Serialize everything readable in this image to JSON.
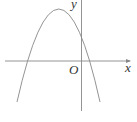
{
  "diagram": {
    "type": "parabola-graph",
    "labels": {
      "x_axis": "x",
      "y_axis": "y",
      "origin": "O"
    },
    "colors": {
      "axis": "#777777",
      "curve": "#777777",
      "text": "#333333"
    }
  }
}
